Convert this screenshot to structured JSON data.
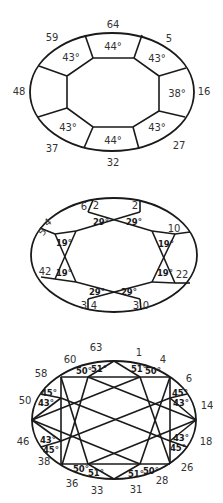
{
  "diagrams": [
    {
      "name": "crown",
      "position_labels": {
        "top": "64",
        "top_right": "5",
        "right": "16",
        "bottom_right": "27",
        "bottom": "32",
        "bottom_left": "37",
        "left": "48",
        "top_left": "59"
      },
      "angles": {
        "top": "44°",
        "top_right": "43°",
        "right": "38°",
        "bottom_right": "43°",
        "bottom": "44°",
        "bottom_left": "43°",
        "top_left": "43°"
      }
    },
    {
      "name": "girdle",
      "position_labels": {
        "top_a_left": "6",
        "top_a_right": "2",
        "top_b": "2",
        "right_top": "10",
        "right_bottom": "22",
        "bottom_b_left": "3",
        "bottom_b_right": "0",
        "bottom_a_left": "3",
        "bottom_a_right": "4",
        "left_bottom": "42",
        "left_top_a": "5",
        "left_top_b": "4"
      },
      "angles": {
        "top_left": "29°",
        "top_right": "29°",
        "right_top": "19°",
        "right_bottom": "19°",
        "bottom_right": "29°",
        "bottom_left": "29°",
        "left_bottom": "19°",
        "left_top": "19°"
      }
    },
    {
      "name": "pavilion",
      "position_labels": {
        "p63": "63",
        "p1": "1",
        "p4": "4",
        "p6": "6",
        "p14": "14",
        "p18": "18",
        "p26": "26",
        "p28": "28",
        "p31": "31",
        "p33": "33",
        "p36": "36",
        "p38": "38",
        "p46": "46",
        "p50": "50",
        "p58": "58",
        "p60": "60"
      },
      "angles": {
        "top_l50": "50°",
        "top_l51": "51°",
        "top_r51": "51°",
        "top_r50": "50°",
        "right_t45": "45°",
        "right_t43": "43°",
        "right_b43": "43°",
        "right_b45": "45°",
        "bot_r50": "50°",
        "bot_r51": "51°",
        "bot_l51": "51°",
        "bot_l50": "50°",
        "left_b45": "45°",
        "left_b43": "43°",
        "left_t43": "43°",
        "left_t45": "45°"
      }
    }
  ]
}
